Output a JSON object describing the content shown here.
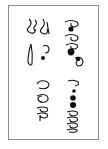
{
  "document": {
    "type": "scanned handwritten glyph sample (rotated 90°)",
    "border_color": "#8a8a8a",
    "ink_color": "#111111",
    "background": "#ffffff",
    "groups": [
      {
        "id": "top-right",
        "description": "sequence of loop glyphs with filled dots",
        "glyph_count": 6
      },
      {
        "id": "top-left",
        "description": "tall hooked glyphs with a long loop and a filled dot",
        "glyph_count": 4
      },
      {
        "id": "bottom-right",
        "description": "row of small loops with filled dots ending in curled strokes",
        "glyph_count": 7
      },
      {
        "id": "bottom-left",
        "description": "three curled loop glyphs",
        "glyph_count": 3
      }
    ]
  }
}
